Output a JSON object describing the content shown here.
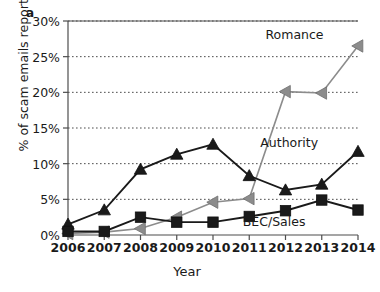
{
  "panel": {
    "label": "a"
  },
  "chart_data": {
    "type": "line",
    "title": "",
    "xlabel": "Year",
    "ylabel": "% of scam emails reported",
    "categories": [
      "2006",
      "2007",
      "2008",
      "2009",
      "2010",
      "2011",
      "2012",
      "2013",
      "2014"
    ],
    "x": [
      2006,
      2007,
      2008,
      2009,
      2010,
      2011,
      2012,
      2013,
      2014
    ],
    "xlim": [
      2006,
      2014
    ],
    "ylim": [
      0,
      30
    ],
    "ytick_values": [
      0,
      5,
      10,
      15,
      20,
      25,
      30
    ],
    "ytick_labels": [
      "0%",
      "5%",
      "10%",
      "15%",
      "20%",
      "25%",
      "30%"
    ],
    "grid": "horizontal-dotted",
    "legend_position": "inline-annotations",
    "series": [
      {
        "name": "Romance",
        "color": "#8c8c8c",
        "marker": "triangle-left",
        "values": [
          0.2,
          0.4,
          0.9,
          2.5,
          4.6,
          5.1,
          20.1,
          19.9,
          26.5
        ],
        "label_x": 2013.05,
        "label_y": 28.2
      },
      {
        "name": "Authority",
        "color": "#1a1a1a",
        "marker": "triangle-up",
        "values": [
          1.5,
          3.5,
          9.2,
          11.3,
          12.7,
          8.3,
          6.3,
          7.1,
          11.7
        ],
        "label_x": 2012.9,
        "label_y": 13.1
      },
      {
        "name": "BEC/Sales",
        "color": "#1a1a1a",
        "marker": "square",
        "values": [
          0.5,
          0.5,
          2.5,
          1.8,
          1.8,
          2.6,
          3.4,
          4.9,
          3.5
        ],
        "label_x": 2012.55,
        "label_y": 2.0
      }
    ]
  }
}
